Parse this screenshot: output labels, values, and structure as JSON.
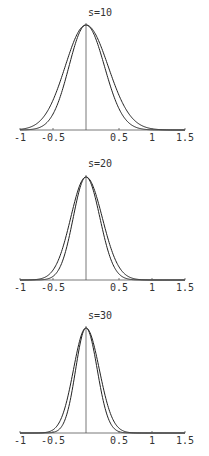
{
  "chart_data": [
    {
      "type": "line",
      "title": "s=10",
      "xlabel": "",
      "ylabel": "",
      "xlim": [
        -1,
        1.5
      ],
      "xticks": [
        "-1",
        "-0.5",
        "0.5",
        "1",
        "1.5"
      ],
      "grid": false,
      "series": [
        {
          "name": "density-a",
          "mean": 0,
          "sd": 0.3,
          "skew": "right"
        },
        {
          "name": "density-b",
          "mean": 0,
          "sd": 0.28,
          "skew": "none"
        }
      ]
    },
    {
      "type": "line",
      "title": "s=20",
      "xlabel": "",
      "ylabel": "",
      "xlim": [
        -1,
        1.5
      ],
      "xticks": [
        "-1",
        "-0.5",
        "0.5",
        "1",
        "1.5"
      ],
      "grid": false,
      "series": [
        {
          "name": "density-a",
          "mean": 0,
          "sd": 0.22,
          "skew": "right"
        },
        {
          "name": "density-b",
          "mean": 0,
          "sd": 0.21,
          "skew": "none"
        }
      ]
    },
    {
      "type": "line",
      "title": "s=30",
      "xlabel": "",
      "ylabel": "",
      "xlim": [
        -1,
        1.5
      ],
      "xticks": [
        "-1",
        "-0.5",
        "0.5",
        "1",
        "1.5"
      ],
      "grid": false,
      "series": [
        {
          "name": "density-a",
          "mean": 0,
          "sd": 0.18,
          "skew": "right"
        },
        {
          "name": "density-b",
          "mean": 0,
          "sd": 0.17,
          "skew": "none"
        }
      ]
    }
  ],
  "panels": [
    {
      "title": "s=10",
      "axis_y": 130,
      "peak_y": 25,
      "title_y": 16
    },
    {
      "title": "s=20",
      "axis_y": 280,
      "peak_y": 177,
      "title_y": 167
    },
    {
      "title": "s=30",
      "axis_y": 433,
      "peak_y": 328,
      "title_y": 319
    }
  ],
  "axis": {
    "x0": 86,
    "scale": 66,
    "xmin": -1,
    "xmax": 1.5,
    "ticks": [
      {
        "v": -1,
        "t": "-1"
      },
      {
        "v": -0.5,
        "t": "-0.5"
      },
      {
        "v": 0.5,
        "t": "0.5"
      },
      {
        "v": 1,
        "t": "1"
      },
      {
        "v": 1.5,
        "t": "1.5"
      }
    ]
  },
  "colors": {
    "line": "#222222",
    "axis": "#555555"
  }
}
